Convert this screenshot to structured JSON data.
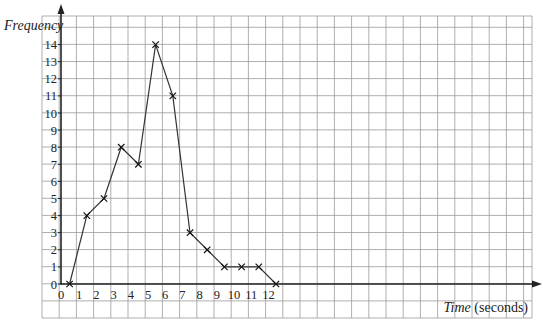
{
  "chart_data": {
    "type": "line",
    "title": "",
    "xlabel": "Time (seconds)",
    "xlabel_italic": "Time",
    "xlabel_rest": " (seconds)",
    "ylabel": "Frequency",
    "x_ticks": [
      0,
      1,
      2,
      3,
      4,
      5,
      6,
      7,
      8,
      9,
      10,
      11,
      12
    ],
    "y_ticks": [
      0,
      1,
      2,
      3,
      4,
      5,
      6,
      7,
      8,
      9,
      10,
      11,
      12,
      13,
      14
    ],
    "xlim": [
      0,
      13.5
    ],
    "ylim": [
      0,
      15.8
    ],
    "grid": true,
    "marker": "x",
    "series": [
      {
        "name": "Frequency polygon",
        "x": [
          0.5,
          1.5,
          2.5,
          3.5,
          4.5,
          5.5,
          6.5,
          7.5,
          8.5,
          9.5,
          10.5,
          11.5,
          12.5
        ],
        "values": [
          0,
          4,
          5,
          8,
          7,
          14,
          11,
          3,
          2,
          1,
          1,
          1,
          0
        ]
      }
    ]
  },
  "style": {
    "grid_color": "#9a9a9a",
    "axis_color": "#222222",
    "line_color": "#333333"
  }
}
